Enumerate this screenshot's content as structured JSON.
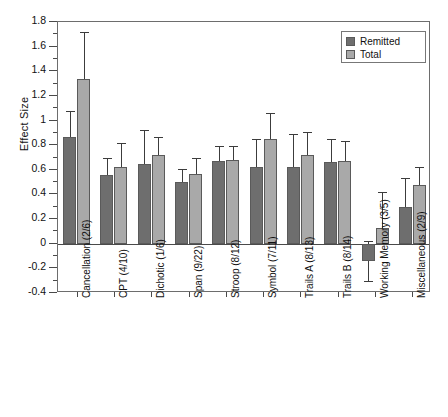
{
  "figure": {
    "ylabel": "Effect Size",
    "caption": ""
  },
  "legend": {
    "position": "top-right",
    "items": [
      {
        "label": "Remitted",
        "color": "#6e6e6e"
      },
      {
        "label": "Total",
        "color": "#a9a9a9"
      }
    ]
  },
  "axis": {
    "y_ticks": [
      "1.8",
      "1.6",
      "1.4",
      "1.2",
      "1",
      "0.8",
      "0.6",
      "0.4",
      "0.2",
      "0",
      "-0.2",
      "-0.4"
    ]
  },
  "chart_data": {
    "type": "bar",
    "title": "",
    "xlabel": "",
    "ylabel": "Effect Size",
    "ylim": [
      -0.4,
      1.8
    ],
    "ytick_step": 0.2,
    "grid": false,
    "legend_position": "top-right",
    "categories": [
      "Cancellation (2/6)",
      "CPT (4/10)",
      "Dichotic (1/6)",
      "Span (9/22)",
      "Stroop (8/12)",
      "Symbol (7/11)",
      "Trails A (8/13)",
      "Trails B (8/14)",
      "Working Memory (3/5)",
      "Miscellaneous (2/9)"
    ],
    "series": [
      {
        "name": "Remitted",
        "color": "#6e6e6e",
        "values": [
          0.87,
          0.56,
          0.65,
          0.5,
          0.67,
          0.62,
          0.62,
          0.66,
          -0.14,
          0.3
        ],
        "err_upper": [
          1.08,
          0.7,
          0.92,
          0.61,
          0.79,
          0.85,
          0.89,
          0.85,
          0.02,
          0.53
        ],
        "err_lower": [
          0.66,
          0.42,
          0.38,
          0.39,
          0.55,
          0.39,
          0.35,
          0.47,
          -0.3,
          0.07
        ]
      },
      {
        "name": "Total",
        "color": "#a9a9a9",
        "values": [
          1.34,
          0.62,
          0.72,
          0.57,
          0.68,
          0.85,
          0.72,
          0.67,
          0.13,
          0.48
        ],
        "err_upper": [
          1.72,
          0.82,
          0.87,
          0.7,
          0.79,
          1.06,
          0.91,
          0.83,
          0.42,
          0.62
        ],
        "err_lower": [
          0.96,
          0.42,
          0.57,
          0.44,
          0.57,
          0.64,
          0.53,
          0.51,
          -0.16,
          0.34
        ]
      }
    ]
  }
}
